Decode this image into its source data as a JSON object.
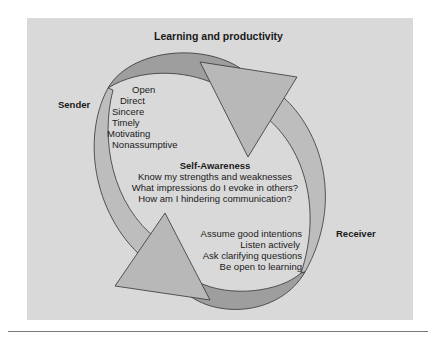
{
  "diagram": {
    "title": "Learning and productivity",
    "sender": {
      "label": "Sender",
      "qualities": [
        "Open",
        "Direct",
        "Sincere",
        "Timely",
        "Motivating",
        "Nonassumptive"
      ]
    },
    "center": {
      "heading": "Self-Awareness",
      "questions": [
        "Know my strengths and weaknesses",
        "What impressions do I evoke in others?",
        "How am I hindering communication?"
      ]
    },
    "receiver": {
      "label": "Receiver",
      "behaviors": [
        "Assume good intentions",
        "Listen actively",
        "Ask clarifying questions",
        "Be open to learning"
      ]
    },
    "colors": {
      "background": "#d9d9d9",
      "dark_band": "#9e9e9e",
      "light_band": "#bdbdbd",
      "arrowhead": "#b8b8b8",
      "stroke": "#333333"
    }
  }
}
